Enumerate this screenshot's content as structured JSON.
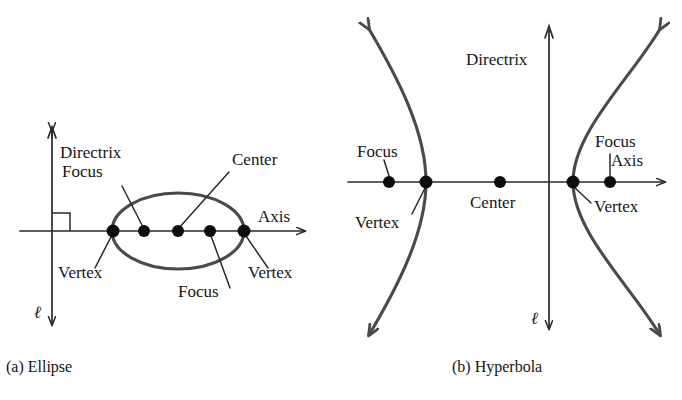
{
  "figure": {
    "background_color": "#ffffff",
    "ink_color": "#1a1a1a",
    "curve_color": "#4a4a4a"
  },
  "panels": [
    {
      "id": "ellipse",
      "caption": "(a) Ellipse",
      "caption_pos": {
        "x": 6,
        "y": 372
      },
      "axes": {
        "horizontal_label": "Axis",
        "horizontal_label_pos": {
          "x": 258,
          "y": 222
        },
        "vertical_label": "Directrix",
        "vertical_label_pos": {
          "x": 60,
          "y": 158
        },
        "line_label": "ℓ",
        "line_label_pos": {
          "x": 34,
          "y": 318
        },
        "horizontal_y": 231,
        "vertical_x": 52,
        "x_start": 20,
        "x_end": 312,
        "y_top": 125,
        "y_bottom": 332
      },
      "shape": {
        "type": "ellipse",
        "center": {
          "x": 178,
          "y": 231
        },
        "rx": 66,
        "ry": 38
      },
      "points": [
        {
          "name": "vertex-left",
          "label": "Vertex",
          "x": 113,
          "y": 231,
          "label_pos": {
            "x": 58,
            "y": 278
          },
          "leader_to": {
            "x": 95,
            "y": 268
          }
        },
        {
          "name": "focus-left",
          "label": "Focus",
          "x": 144,
          "y": 231,
          "label_pos": {
            "x": 62,
            "y": 177
          },
          "leader_to": {
            "x": 122,
            "y": 185
          }
        },
        {
          "name": "center",
          "label": "Center",
          "x": 178,
          "y": 231,
          "label_pos": {
            "x": 232,
            "y": 165
          },
          "leader_to": {
            "x": 228,
            "y": 172
          }
        },
        {
          "name": "focus-right",
          "label": "Focus",
          "x": 210,
          "y": 231,
          "label_pos": {
            "x": 178,
            "y": 297
          },
          "leader_to": {
            "x": 230,
            "y": 288
          }
        },
        {
          "name": "vertex-right",
          "label": "Vertex",
          "x": 244,
          "y": 231,
          "label_pos": {
            "x": 248,
            "y": 278
          },
          "leader_to": {
            "x": 268,
            "y": 268
          }
        }
      ]
    },
    {
      "id": "hyperbola",
      "caption": "(b) Hyperbola",
      "caption_pos": {
        "x": 452,
        "y": 372
      },
      "axes": {
        "horizontal_label": "Axis",
        "horizontal_label_pos": {
          "x": 611,
          "y": 166
        },
        "vertical_label": "Directrix",
        "vertical_label_pos": {
          "x": 466,
          "y": 65
        },
        "line_label": "ℓ",
        "line_label_pos": {
          "x": 531,
          "y": 324
        },
        "horizontal_y": 182,
        "vertical_x": 549,
        "x_start": 348,
        "x_end": 672,
        "y_top": 22,
        "y_bottom": 336
      },
      "shape": {
        "type": "hyperbola",
        "center": {
          "x": 549,
          "y": 182
        },
        "left_vertex_x": 426,
        "right_vertex_x": 573,
        "left_branch_top_tip": {
          "x": 363,
          "y": 23
        },
        "left_branch_bottom_tip": {
          "x": 363,
          "y": 341
        },
        "right_branch_top_tip": {
          "x": 666,
          "y": 23
        },
        "right_branch_bottom_tip": {
          "x": 666,
          "y": 341
        }
      },
      "points": [
        {
          "name": "focus-left",
          "label": "Focus",
          "x": 389,
          "y": 182,
          "label_pos": {
            "x": 357,
            "y": 157
          },
          "leader_to": {
            "x": 384,
            "y": 168
          }
        },
        {
          "name": "vertex-left",
          "label": "Vertex",
          "x": 426,
          "y": 182,
          "label_pos": {
            "x": 355,
            "y": 228
          },
          "leader_to": {
            "x": 414,
            "y": 214
          }
        },
        {
          "name": "center",
          "label": "Center",
          "x": 500,
          "y": 182,
          "label_pos": {
            "x": 470,
            "y": 208
          },
          "leader_to": null
        },
        {
          "name": "vertex-right",
          "label": "Vertex",
          "x": 573,
          "y": 182,
          "label_pos": {
            "x": 594,
            "y": 212
          },
          "leader_to": {
            "x": 589,
            "y": 203
          }
        },
        {
          "name": "focus-right",
          "label": "Focus",
          "x": 610,
          "y": 182,
          "label_pos": {
            "x": 595,
            "y": 147
          },
          "leader_to": {
            "x": 610,
            "y": 158
          }
        }
      ]
    }
  ]
}
